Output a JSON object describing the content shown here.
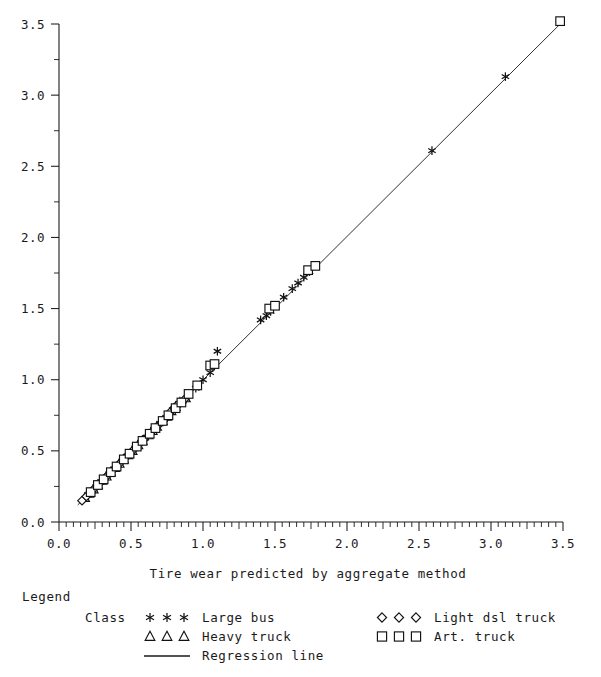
{
  "chart_data": {
    "type": "scatter",
    "title": "",
    "xlabel": "Tire wear predicted by aggregate method",
    "ylabel": "",
    "xlim": [
      0.0,
      3.5
    ],
    "ylim": [
      0.0,
      3.5
    ],
    "grid": false,
    "x_ticks": [
      "0.0",
      "0.5",
      "1.0",
      "1.5",
      "2.0",
      "2.5",
      "3.0",
      "3.5"
    ],
    "x_tick_values": [
      0.0,
      0.5,
      1.0,
      1.5,
      2.0,
      2.5,
      3.0,
      3.5
    ],
    "y_ticks": [
      "0.0",
      "0.5",
      "1.0",
      "1.5",
      "2.0",
      "2.5",
      "3.0",
      "3.5"
    ],
    "y_tick_values": [
      0.0,
      0.5,
      1.0,
      1.5,
      2.0,
      2.5,
      3.0,
      3.5
    ],
    "x_minor_step": 0.05,
    "y_minor_step": 0.25,
    "legend_position": "below-plot",
    "regression_line": {
      "name": "Regression line",
      "x": [
        0.13,
        3.5
      ],
      "y": [
        0.12,
        3.52
      ]
    },
    "series": [
      {
        "name": "Large bus",
        "marker": "star",
        "points": [
          [
            0.2,
            0.19
          ],
          [
            0.23,
            0.22
          ],
          [
            0.26,
            0.25
          ],
          [
            0.29,
            0.28
          ],
          [
            0.32,
            0.31
          ],
          [
            0.35,
            0.34
          ],
          [
            0.38,
            0.37
          ],
          [
            0.41,
            0.4
          ],
          [
            0.44,
            0.43
          ],
          [
            0.47,
            0.46
          ],
          [
            0.5,
            0.49
          ],
          [
            0.53,
            0.52
          ],
          [
            0.57,
            0.56
          ],
          [
            0.6,
            0.59
          ],
          [
            0.63,
            0.62
          ],
          [
            0.66,
            0.65
          ],
          [
            0.7,
            0.69
          ],
          [
            0.73,
            0.72
          ],
          [
            0.76,
            0.76
          ],
          [
            0.79,
            0.79
          ],
          [
            0.82,
            0.82
          ],
          [
            0.86,
            0.85
          ],
          [
            0.9,
            0.89
          ],
          [
            0.95,
            0.94
          ],
          [
            1.0,
            1.0
          ],
          [
            1.05,
            1.05
          ],
          [
            1.1,
            1.2
          ],
          [
            1.4,
            1.42
          ],
          [
            1.44,
            1.45
          ],
          [
            1.47,
            1.48
          ],
          [
            1.56,
            1.58
          ],
          [
            1.62,
            1.64
          ],
          [
            1.66,
            1.68
          ],
          [
            1.7,
            1.72
          ],
          [
            1.74,
            1.76
          ],
          [
            2.59,
            2.61
          ],
          [
            3.1,
            3.13
          ]
        ]
      },
      {
        "name": "Heavy truck",
        "marker": "triangle",
        "points": [
          [
            0.18,
            0.17
          ],
          [
            0.21,
            0.2
          ],
          [
            0.24,
            0.23
          ],
          [
            0.27,
            0.26
          ],
          [
            0.3,
            0.29
          ],
          [
            0.33,
            0.32
          ],
          [
            0.36,
            0.35
          ],
          [
            0.39,
            0.38
          ],
          [
            0.42,
            0.41
          ],
          [
            0.45,
            0.44
          ],
          [
            0.48,
            0.47
          ],
          [
            0.51,
            0.5
          ],
          [
            0.55,
            0.54
          ],
          [
            0.58,
            0.57
          ],
          [
            0.62,
            0.61
          ],
          [
            0.65,
            0.64
          ],
          [
            0.68,
            0.67
          ],
          [
            0.72,
            0.71
          ],
          [
            0.75,
            0.74
          ],
          [
            0.78,
            0.78
          ],
          [
            0.81,
            0.81
          ],
          [
            0.84,
            0.84
          ],
          [
            0.88,
            0.87
          ]
        ]
      },
      {
        "name": "Light dsl truck",
        "marker": "diamond",
        "points": [
          [
            0.16,
            0.15
          ],
          [
            0.19,
            0.18
          ],
          [
            0.22,
            0.21
          ],
          [
            0.25,
            0.24
          ],
          [
            0.28,
            0.27
          ],
          [
            0.31,
            0.3
          ],
          [
            0.34,
            0.33
          ],
          [
            0.37,
            0.36
          ],
          [
            0.4,
            0.39
          ],
          [
            0.43,
            0.42
          ],
          [
            0.46,
            0.45
          ],
          [
            0.49,
            0.48
          ],
          [
            0.52,
            0.51
          ],
          [
            0.56,
            0.55
          ],
          [
            0.59,
            0.58
          ],
          [
            0.64,
            0.63
          ],
          [
            0.67,
            0.66
          ],
          [
            0.71,
            0.7
          ],
          [
            0.74,
            0.73
          ],
          [
            0.77,
            0.77
          ],
          [
            0.8,
            0.8
          ],
          [
            0.83,
            0.83
          ],
          [
            0.87,
            0.86
          ]
        ]
      },
      {
        "name": "Art. truck",
        "marker": "square",
        "points": [
          [
            0.22,
            0.21
          ],
          [
            0.27,
            0.26
          ],
          [
            0.31,
            0.3
          ],
          [
            0.36,
            0.35
          ],
          [
            0.4,
            0.39
          ],
          [
            0.45,
            0.44
          ],
          [
            0.49,
            0.48
          ],
          [
            0.54,
            0.53
          ],
          [
            0.58,
            0.57
          ],
          [
            0.63,
            0.62
          ],
          [
            0.67,
            0.66
          ],
          [
            0.72,
            0.71
          ],
          [
            0.76,
            0.75
          ],
          [
            0.81,
            0.8
          ],
          [
            0.85,
            0.84
          ],
          [
            0.9,
            0.9
          ],
          [
            0.96,
            0.96
          ],
          [
            1.05,
            1.1
          ],
          [
            1.08,
            1.11
          ],
          [
            1.46,
            1.5
          ],
          [
            1.5,
            1.52
          ],
          [
            1.73,
            1.77
          ],
          [
            1.78,
            1.8
          ],
          [
            3.48,
            3.52
          ]
        ]
      }
    ]
  },
  "legend": {
    "heading": "Legend",
    "class_label": "Class",
    "entries": [
      {
        "label": "Large bus",
        "marker": "star"
      },
      {
        "label": "Heavy truck",
        "marker": "triangle"
      },
      {
        "label": "Regression line",
        "marker": "line"
      },
      {
        "label": "Light dsl truck",
        "marker": "diamond"
      },
      {
        "label": "Art. truck",
        "marker": "square"
      }
    ]
  },
  "colors": {
    "foreground": "#1a1a1a",
    "marker_stroke": "#111111",
    "marker_fill": "#ffffff",
    "background": "#ffffff"
  }
}
